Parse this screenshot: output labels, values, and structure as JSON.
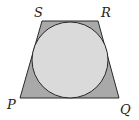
{
  "diagram": {
    "shape": "trapezoid",
    "vertices": {
      "S": {
        "label": "S",
        "x": 42,
        "y": 21
      },
      "R": {
        "label": "R",
        "x": 98,
        "y": 21
      },
      "Q": {
        "label": "Q",
        "x": 119,
        "y": 98
      },
      "P": {
        "label": "P",
        "x": 20,
        "y": 98
      }
    },
    "circle": {
      "cx": 70,
      "cy": 60,
      "r": 38
    },
    "colors": {
      "trapezoid_fill": "#a9a9a9",
      "circle_fill": "#dadada",
      "stroke": "#2a2a2a"
    }
  }
}
